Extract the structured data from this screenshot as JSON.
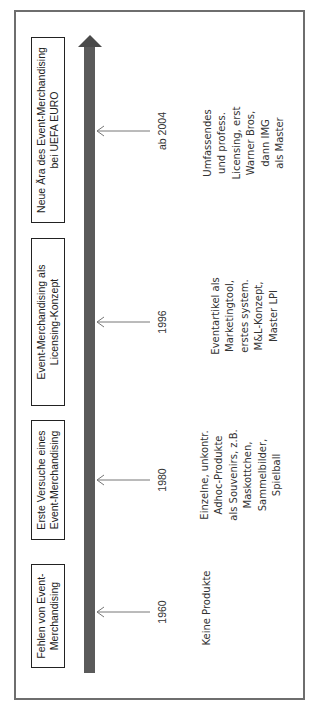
{
  "diagram": {
    "type": "timeline",
    "orientation": "rotated-90-ccw",
    "colors": {
      "timeline_arrow": "#5a5a5a",
      "frame": "#6e6e6e",
      "pointer": "#777777",
      "box_border": "#222222"
    },
    "milestones": [
      {
        "year": "1960",
        "phase": [
          "Fehlen von Event-",
          "Merchandising"
        ],
        "description": [
          "Keine Produkte"
        ]
      },
      {
        "year": "1980",
        "phase": [
          "Erste Versuche eines",
          "Event-Merchandising"
        ],
        "description": [
          "Einzelne, unkontr.",
          "Adhoc-Produkte",
          "als Souvenirs, z.B.",
          "Maskottchen,",
          "Sammelbilder,",
          "Spielball"
        ]
      },
      {
        "year": "1996",
        "phase": [
          "Event-Merchandising als",
          "Licensing-Konzept"
        ],
        "description": [
          "Eventartikel als",
          "Marketingtool,",
          "erstes system.",
          "M&L-Konzept,",
          "Master LPI"
        ]
      },
      {
        "year": "ab 2004",
        "phase": [
          "Neue Ära des Event-Merchandising",
          "bei UEFA EURO"
        ],
        "description": [
          "Umfassendes",
          "und profess.",
          "Licensing, erst",
          "Warner Bros,",
          "dann IMG",
          "als Master"
        ]
      }
    ]
  }
}
